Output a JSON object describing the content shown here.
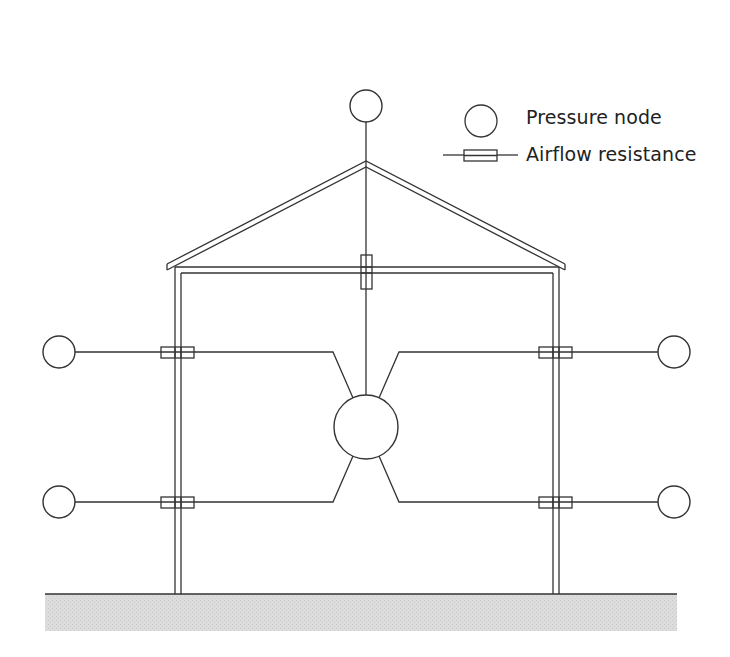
{
  "legend": {
    "pressure_node_label": "Pressure node",
    "airflow_resistance_label": "Airflow resistance"
  },
  "colors": {
    "line": "#333333",
    "ground_fill": "#d9d9d9",
    "background": "#ffffff"
  },
  "diagram": {
    "pressure_nodes": [
      {
        "name": "outside-roof-node",
        "cx": 366,
        "cy": 106,
        "r": 16
      },
      {
        "name": "outside-left-upper-node",
        "cx": 59,
        "cy": 352,
        "r": 16
      },
      {
        "name": "outside-left-lower-node",
        "cx": 59,
        "cy": 502,
        "r": 16
      },
      {
        "name": "outside-right-upper-node",
        "cx": 674,
        "cy": 352,
        "r": 16
      },
      {
        "name": "outside-right-lower-node",
        "cx": 674,
        "cy": 502,
        "r": 16
      },
      {
        "name": "interior-node",
        "cx": 366,
        "cy": 427,
        "r": 32
      }
    ],
    "resistances": [
      {
        "name": "ceiling-resistance",
        "x": 361,
        "y": 255,
        "w": 11,
        "h": 34
      },
      {
        "name": "left-upper-wall-resistance",
        "x": 161,
        "y": 347,
        "w": 33,
        "h": 11
      },
      {
        "name": "left-lower-wall-resistance",
        "x": 161,
        "y": 497,
        "w": 33,
        "h": 11
      },
      {
        "name": "right-upper-wall-resistance",
        "x": 539,
        "y": 347,
        "w": 33,
        "h": 11
      },
      {
        "name": "right-lower-wall-resistance",
        "x": 539,
        "y": 497,
        "w": 33,
        "h": 11
      }
    ]
  }
}
